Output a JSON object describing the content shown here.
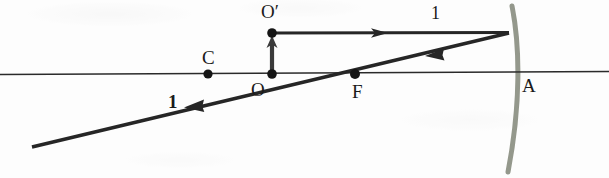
{
  "figure": {
    "kind": "optics-ray-diagram",
    "width": 609,
    "height": 178,
    "background_color": "#fdfdfd"
  },
  "colors": {
    "ink": "#1a1a1a",
    "axis": "#2a2a2a",
    "ray": "#262626",
    "mirror": "#8b8f82"
  },
  "points": [
    {
      "id": "C",
      "label": "C",
      "x": 208,
      "y": 74,
      "label_x": 202,
      "label_y": 48,
      "dot_radius": 4.6
    },
    {
      "id": "O",
      "label": "O",
      "x": 272,
      "y": 74,
      "label_x": 251,
      "label_y": 80,
      "dot_radius": 4.8
    },
    {
      "id": "Oprime",
      "label": "O′",
      "x": 272,
      "y": 33,
      "label_x": 261,
      "label_y": 2,
      "dot_radius": 4.8
    },
    {
      "id": "F",
      "label": "F",
      "x": 355,
      "y": 74,
      "label_x": 352,
      "label_y": 82,
      "dot_radius": 5.0
    },
    {
      "id": "A",
      "label": "A",
      "x": 516,
      "y": 72,
      "label_x": 522,
      "label_y": 76,
      "dot_radius": 0
    }
  ],
  "axis": {
    "name": "principal-axis",
    "x1": 0,
    "y1": 74.6,
    "x2": 609,
    "y2": 71.4,
    "stroke_width": 1.5
  },
  "mirror": {
    "name": "concave-mirror",
    "vertex_x": 516,
    "path": "M 512 6 C 520 46 521 104 508 172",
    "stroke_width": 5,
    "color": "#8b8f82"
  },
  "rays": [
    {
      "id": "incident-parallel",
      "label": "1",
      "label_x": 431,
      "label_y": 4,
      "label_style": "plain",
      "x1": 272,
      "y1": 33,
      "x2": 508,
      "y2": 33,
      "arrow_at": 0.46,
      "stroke_width": 3.2
    },
    {
      "id": "reflected-through-focus",
      "label": "1",
      "label_x": 168,
      "label_y": 92,
      "label_style": "bold",
      "x1": 508,
      "y1": 33,
      "x2": 32,
      "y2": 147,
      "arrow_at": 0.155,
      "arrow_at_2": 0.72,
      "stroke_width": 3.4
    }
  ],
  "object_arrow": {
    "id": "object-arrow",
    "x": 272,
    "y_base": 74,
    "y_tip": 36,
    "stroke_width": 4.2
  }
}
